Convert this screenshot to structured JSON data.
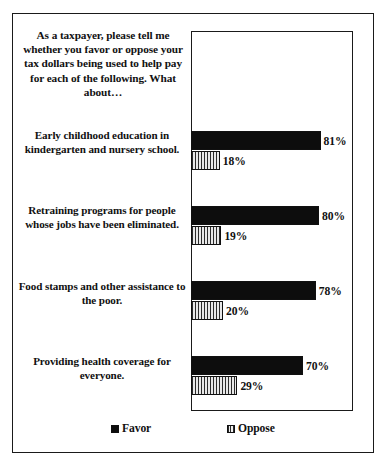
{
  "chart_data": {
    "type": "bar",
    "orientation": "horizontal",
    "title": "As a taxpayer, please tell me whether you favor or oppose your tax dollars being used to help pay for each of the following. What about…",
    "xlabel": "",
    "ylabel": "",
    "xlim": [
      0,
      100
    ],
    "grid": false,
    "legend_position": "bottom",
    "value_suffix": "%",
    "categories": [
      "Early childhood education in kindergarten and nursery school.",
      "Retraining programs for people whose jobs have been eliminated.",
      "Food stamps and other assistance to the poor.",
      "Providing health coverage for everyone."
    ],
    "series": [
      {
        "name": "Favor",
        "values": [
          81,
          80,
          78,
          70
        ],
        "color": "#0d0d0d",
        "pattern": "solid"
      },
      {
        "name": "Oppose",
        "values": [
          18,
          19,
          20,
          29
        ],
        "color": "#cdcdcd",
        "pattern": "vertical-hatch"
      }
    ],
    "value_labels": {
      "favor": [
        "81%",
        "80%",
        "78%",
        "70%"
      ],
      "oppose": [
        "18%",
        "19%",
        "20%",
        "29%"
      ]
    }
  },
  "legend": {
    "favor_label": "Favor",
    "oppose_label": "Oppose"
  }
}
